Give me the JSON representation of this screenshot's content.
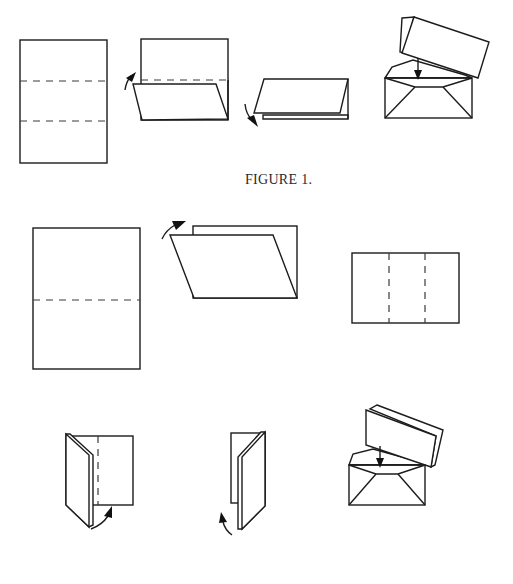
{
  "figures": [
    {
      "caption": "FIGURE 1.",
      "steps": [
        {
          "name": "sheet-with-two-fold-lines",
          "fold_lines": 2,
          "fold_orientation": "horizontal"
        },
        {
          "name": "fold-bottom-third-up",
          "arrow": "curved-up"
        },
        {
          "name": "fold-top-third-down",
          "arrow": "curved-down"
        },
        {
          "name": "insert-into-envelope",
          "arrow": "down"
        }
      ]
    },
    {
      "caption": "",
      "steps": [
        {
          "name": "sheet-with-one-fold-line",
          "fold_lines": 1,
          "fold_orientation": "horizontal"
        },
        {
          "name": "fold-in-half",
          "arrow": "curved-up"
        },
        {
          "name": "folded-sheet-with-two-fold-lines",
          "fold_lines": 2,
          "fold_orientation": "vertical"
        },
        {
          "name": "fold-left-third",
          "arrow": "curved-up"
        },
        {
          "name": "fold-right-third",
          "arrow": "curved-up"
        },
        {
          "name": "insert-into-envelope",
          "arrow": "down"
        }
      ]
    }
  ],
  "colors": {
    "ink": "#1c1c1c",
    "paper": "#ffffff"
  }
}
